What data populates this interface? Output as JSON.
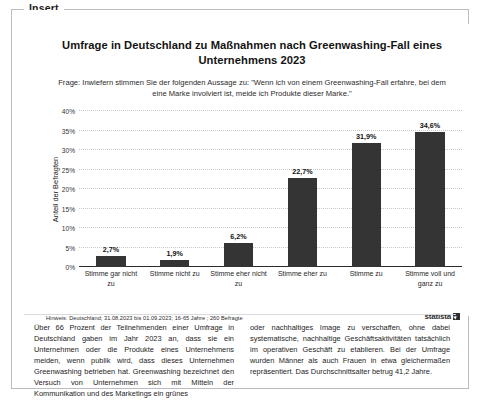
{
  "frame": {
    "legend": "Insert"
  },
  "chart_data": {
    "type": "bar",
    "title": "Umfrage in Deutschland zu Maßnahmen nach Greenwashing-Fall eines Unternehmens 2023",
    "subtitle": "Frage: Inwiefern stimmen Sie der folgenden Aussage zu: \"Wenn ich von einem Greenwashing-Fall erfahre, bei dem eine Marke involviert ist, meide ich Produkte dieser Marke.\"",
    "xlabel": "",
    "ylabel": "Anteil der Befragten",
    "categories": [
      "Stimme gar nicht zu",
      "Stimme nicht zu",
      "Stimme eher nicht zu",
      "Stimme eher zu",
      "Stimme zu",
      "Stimme voll und ganz zu"
    ],
    "values": [
      2.7,
      1.9,
      6.2,
      22.7,
      31.9,
      34.6
    ],
    "value_labels": [
      "2,7%",
      "1,9%",
      "6,2%",
      "22,7%",
      "31,9%",
      "34,6%"
    ],
    "ylim": [
      0,
      40
    ],
    "yticks": [
      0,
      5,
      10,
      15,
      20,
      25,
      30,
      35,
      40
    ],
    "ytick_labels": [
      "0%",
      "5%",
      "10%",
      "15%",
      "20%",
      "25%",
      "30%",
      "35%",
      "40%"
    ],
    "grid": true,
    "legend_position": "none",
    "bar_color": "#343434",
    "note": "Hinweis: Deutschland; 31.08.2023 bis 01.09.2023; 16-65 Jahre ; 260 Befragte",
    "source_brand": "statista"
  },
  "article": {
    "column_left": "Über 66 Prozent der Teilnehmenden einer Umfrage in Deutschland gaben im Jahr 2023 an, dass sie ein Unternehmen oder die Produkte eines Unternehmens meiden, wenn publik wird, dass dieses Unternehmen Greenwashing betrieben hat. Greenwashing bezeichnet den Versuch von Unternehmen sich mit Mitteln der Kommunikation und des Marketings ein grünes",
    "column_right": "oder nachhaltiges Image zu verschaffen, ohne dabei systematische, nachhaltige Geschäftsaktivitäten tatsächlich im operativen Geschäft zu etablieren. Bei der Umfrage wurden Männer als auch Frauen in etwa gleichermaßen repräsentiert. Das Durchschnittsalter betrug 41,2 Jahre."
  }
}
